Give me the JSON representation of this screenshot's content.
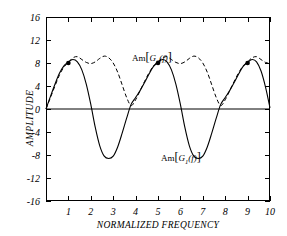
{
  "chart_data": {
    "type": "line",
    "title": "",
    "xlabel": "NORMALIZED  FREQUENCY",
    "ylabel": "AMPLITUDE",
    "xlim": [
      0,
      10
    ],
    "ylim": [
      -16,
      16
    ],
    "xticks": [
      1,
      2,
      3,
      4,
      5,
      6,
      7,
      8,
      9,
      10
    ],
    "yticks": [
      16,
      12,
      8,
      4,
      0,
      -4,
      -8,
      -12,
      -16
    ],
    "grid": false,
    "legend_position": "inline-annotations",
    "zero_line": true,
    "annotations": [
      {
        "text": "Am[G2(t)]",
        "x": 2.0,
        "y": 11.6,
        "series": "Am[G2(t)]"
      },
      {
        "text": "Am[G1(t)]",
        "x": 3.4,
        "y": -5.4,
        "series": "Am[G1(t)]"
      }
    ],
    "markers": {
      "label": "peak-markers",
      "x": [
        1,
        5,
        9
      ],
      "y": [
        8,
        8,
        8
      ]
    },
    "series": [
      {
        "name": "Am[G1(t)]",
        "style": "solid",
        "color": "#000000",
        "x": [
          0.0,
          0.2,
          0.4,
          0.6,
          0.8,
          1.0,
          1.2,
          1.4,
          1.6,
          1.8,
          2.0,
          2.2,
          2.4,
          2.6,
          2.8,
          3.0,
          3.2,
          3.4,
          3.6,
          3.8,
          4.0,
          4.2,
          4.4,
          4.6,
          4.8,
          5.0,
          5.2,
          5.4,
          5.6,
          5.8,
          6.0,
          6.2,
          6.4,
          6.6,
          6.8,
          7.0,
          7.2,
          7.4,
          7.6,
          7.8,
          8.0,
          8.2,
          8.4,
          8.6,
          8.8,
          9.0,
          9.2,
          9.4,
          9.6,
          9.8,
          10.0
        ],
        "y": [
          0.0,
          2.2,
          4.3,
          6.2,
          7.5,
          8.2,
          8.6,
          8.2,
          6.8,
          4.3,
          0.8,
          -3.2,
          -6.4,
          -8.2,
          -8.6,
          -8.2,
          -6.6,
          -4.2,
          -1.6,
          0.8,
          2.0,
          3.2,
          4.6,
          6.1,
          7.4,
          8.1,
          8.6,
          8.2,
          6.8,
          4.3,
          0.8,
          -3.2,
          -6.4,
          -8.2,
          -8.6,
          -8.2,
          -6.6,
          -4.2,
          -1.6,
          0.8,
          2.0,
          3.2,
          4.6,
          6.1,
          7.4,
          8.1,
          8.6,
          8.2,
          6.6,
          3.8,
          0.2
        ]
      },
      {
        "name": "Am[G2(t)]",
        "style": "dashed",
        "color": "#000000",
        "x": [
          0.0,
          0.2,
          0.4,
          0.6,
          0.8,
          1.0,
          1.2,
          1.4,
          1.6,
          1.8,
          2.0,
          2.2,
          2.4,
          2.6,
          2.8,
          3.0,
          3.2,
          3.4,
          3.6,
          3.8,
          4.0,
          4.2,
          4.4,
          4.6,
          4.8,
          5.0,
          5.2,
          5.4,
          5.6,
          5.8,
          6.0,
          6.2,
          6.4,
          6.6,
          6.8,
          7.0,
          7.2,
          7.4,
          7.6,
          7.8,
          8.0,
          8.2,
          8.4,
          8.6,
          8.8,
          9.0,
          9.2,
          9.4,
          9.6,
          9.8,
          10.0
        ],
        "y": [
          0.0,
          2.0,
          4.0,
          5.9,
          7.3,
          8.1,
          8.9,
          9.1,
          8.6,
          8.1,
          7.9,
          8.2,
          8.8,
          9.2,
          8.9,
          8.0,
          6.4,
          4.2,
          2.0,
          0.6,
          1.6,
          3.2,
          4.8,
          6.3,
          7.5,
          8.2,
          8.9,
          9.1,
          8.6,
          8.1,
          7.9,
          8.2,
          8.8,
          9.2,
          8.9,
          8.0,
          6.4,
          4.2,
          2.0,
          0.6,
          1.6,
          3.2,
          4.8,
          6.3,
          7.5,
          8.2,
          8.9,
          9.1,
          8.6,
          8.1,
          7.9
        ]
      }
    ]
  },
  "labels": {
    "ytitle": "AMPLITUDE",
    "xtitle": "NORMALIZED  FREQUENCY",
    "am_prefix": "Am",
    "g2_base": "G",
    "g2_sub": "2",
    "g1_base": "G",
    "g1_sub": "1",
    "arg": "(f)",
    "bracket_open": "[",
    "bracket_close": "]"
  },
  "ytick_labels": [
    "16",
    "12",
    "8",
    "4",
    "0",
    "-4",
    "-8",
    "-12",
    "-16"
  ],
  "xtick_labels": [
    "1",
    "2",
    "3",
    "4",
    "5",
    "6",
    "7",
    "8",
    "9",
    "10"
  ]
}
